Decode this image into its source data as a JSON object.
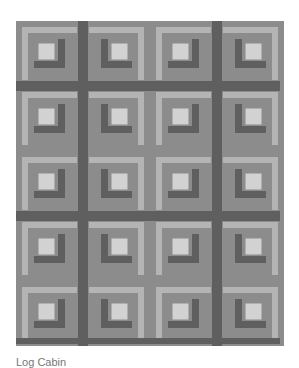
{
  "image": {
    "subject": "log cabin quilt pattern",
    "grid": {
      "columns": 4,
      "rows": 5
    },
    "colors": {
      "background": "#8c8c8c",
      "light": "#b4b4b4",
      "lighter_center": "#d2d2d2",
      "dark": "#5f5f5f",
      "medium": "#8c8c8c"
    }
  },
  "caption": "Log Cabin"
}
